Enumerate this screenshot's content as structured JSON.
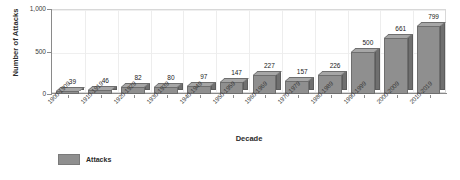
{
  "chart_data": {
    "type": "bar",
    "title": "",
    "subtitle": "",
    "xlabel": "Decade",
    "ylabel": "Number of Attacks",
    "categories": [
      "1900-1909",
      "1910-1919",
      "1920-1929",
      "1930-1939",
      "1940-1949",
      "1950-1959",
      "1960-1969",
      "1970-1979",
      "1980-1989",
      "1990-1999",
      "2000-2009",
      "2010-2019"
    ],
    "values": [
      39,
      46,
      82,
      80,
      97,
      147,
      227,
      157,
      226,
      500,
      661,
      799
    ],
    "series": [
      {
        "name": "Attacks",
        "values": [
          39,
          46,
          82,
          80,
          97,
          147,
          227,
          157,
          226,
          500,
          661,
          799
        ]
      }
    ],
    "data_labels": [
      "39",
      "46",
      "82",
      "80",
      "97",
      "147",
      "227",
      "157",
      "226",
      "500",
      "661",
      "799"
    ],
    "ylim": [
      0,
      1000
    ],
    "ytick_values": [
      0,
      500,
      1000
    ],
    "ytick_labels": [
      "0",
      "500",
      "1,000"
    ],
    "grid": "vertical-category-separators",
    "legend_position": "bottom-left",
    "bar_color": "#8f8f8f",
    "bar_side_color": "#6f6f6f",
    "bar_top_color": "#a6a6a6",
    "bar_border_color": "#6e6e6e",
    "three_d": true,
    "xlabel_rotation": -45
  },
  "legend": {
    "entries": [
      {
        "label": "Attacks",
        "color": "#8f8f8f"
      }
    ]
  }
}
